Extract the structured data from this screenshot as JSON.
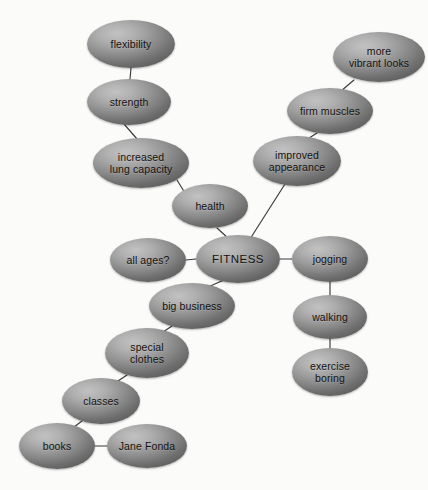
{
  "diagram": {
    "type": "mind-map",
    "background_color": "#fbfbfa",
    "node_fill_light": "#c2c2c2",
    "node_fill_dark": "#636363",
    "edge_color": "#3a3a3a",
    "text_color": "#14110f",
    "nodes": [
      {
        "id": "flexibility",
        "label": "flexibility",
        "cx": 131,
        "cy": 44,
        "rx": 44,
        "ry": 24
      },
      {
        "id": "strength",
        "label": "strength",
        "cx": 129,
        "cy": 102,
        "rx": 42,
        "ry": 23
      },
      {
        "id": "increased_lung",
        "label": "increased\nlung capacity",
        "cx": 141,
        "cy": 163,
        "rx": 48,
        "ry": 25
      },
      {
        "id": "health",
        "label": "health",
        "cx": 210,
        "cy": 206,
        "rx": 38,
        "ry": 22
      },
      {
        "id": "more_vibrant",
        "label": "more\nvibrant looks",
        "cx": 379,
        "cy": 57,
        "rx": 46,
        "ry": 25
      },
      {
        "id": "firm_muscles",
        "label": "firm muscles",
        "cx": 330,
        "cy": 111,
        "rx": 43,
        "ry": 23
      },
      {
        "id": "improved_appear",
        "label": "improved\nappearance",
        "cx": 297,
        "cy": 161,
        "rx": 44,
        "ry": 25
      },
      {
        "id": "all_ages",
        "label": "all ages?",
        "cx": 148,
        "cy": 260,
        "rx": 38,
        "ry": 22
      },
      {
        "id": "fitness",
        "label": "FITNESS",
        "cx": 238,
        "cy": 259,
        "rx": 42,
        "ry": 24,
        "root": true
      },
      {
        "id": "jogging",
        "label": "jogging",
        "cx": 330,
        "cy": 259,
        "rx": 38,
        "ry": 23
      },
      {
        "id": "walking",
        "label": "walking",
        "cx": 330,
        "cy": 317,
        "rx": 37,
        "ry": 22
      },
      {
        "id": "exercise_boring",
        "label": "exercise\nboring",
        "cx": 330,
        "cy": 372,
        "rx": 38,
        "ry": 24
      },
      {
        "id": "big_business",
        "label": "big business",
        "cx": 192,
        "cy": 306,
        "rx": 43,
        "ry": 23
      },
      {
        "id": "special_clothes",
        "label": "special\nclothes",
        "cx": 147,
        "cy": 353,
        "rx": 42,
        "ry": 25
      },
      {
        "id": "classes",
        "label": "classes",
        "cx": 101,
        "cy": 401,
        "rx": 39,
        "ry": 23
      },
      {
        "id": "books",
        "label": "books",
        "cx": 57,
        "cy": 446,
        "rx": 38,
        "ry": 23
      },
      {
        "id": "jane_fonda",
        "label": "Jane Fonda",
        "cx": 147,
        "cy": 446,
        "rx": 40,
        "ry": 22
      }
    ],
    "edges": [
      {
        "from": "flexibility",
        "to": "strength",
        "x1": 131,
        "y1": 68,
        "x2": 130,
        "y2": 79
      },
      {
        "from": "strength",
        "to": "increased_lung",
        "x1": 124,
        "y1": 124,
        "x2": 137,
        "y2": 139
      },
      {
        "from": "increased_lung",
        "to": "health",
        "x1": 177,
        "y1": 180,
        "x2": 185,
        "y2": 193
      },
      {
        "from": "health",
        "to": "fitness",
        "x1": 217,
        "y1": 228,
        "x2": 228,
        "y2": 238
      },
      {
        "from": "more_vibrant",
        "to": "firm_muscles",
        "x1": 354,
        "y1": 80,
        "x2": 341,
        "y2": 91
      },
      {
        "from": "firm_muscles",
        "to": "improved_appear",
        "x1": 317,
        "y1": 133,
        "x2": 306,
        "y2": 140
      },
      {
        "from": "improved_appear",
        "to": "fitness",
        "x1": 285,
        "y1": 184,
        "x2": 250,
        "y2": 239
      },
      {
        "from": "all_ages",
        "to": "fitness",
        "x1": 186,
        "y1": 260,
        "x2": 196,
        "y2": 259
      },
      {
        "from": "fitness",
        "to": "jogging",
        "x1": 280,
        "y1": 259,
        "x2": 292,
        "y2": 259
      },
      {
        "from": "jogging",
        "to": "walking",
        "x1": 330,
        "y1": 282,
        "x2": 330,
        "y2": 295
      },
      {
        "from": "walking",
        "to": "exercise_boring",
        "x1": 330,
        "y1": 339,
        "x2": 330,
        "y2": 348
      },
      {
        "from": "fitness",
        "to": "big_business",
        "x1": 224,
        "y1": 280,
        "x2": 208,
        "y2": 287
      },
      {
        "from": "big_business",
        "to": "special_clothes",
        "x1": 172,
        "y1": 326,
        "x2": 160,
        "y2": 334
      },
      {
        "from": "special_clothes",
        "to": "classes",
        "x1": 127,
        "y1": 375,
        "x2": 115,
        "y2": 383
      },
      {
        "from": "classes",
        "to": "books",
        "x1": 82,
        "y1": 421,
        "x2": 70,
        "y2": 430
      },
      {
        "from": "books",
        "to": "jane_fonda",
        "x1": 95,
        "y1": 446,
        "x2": 107,
        "y2": 446
      }
    ]
  }
}
